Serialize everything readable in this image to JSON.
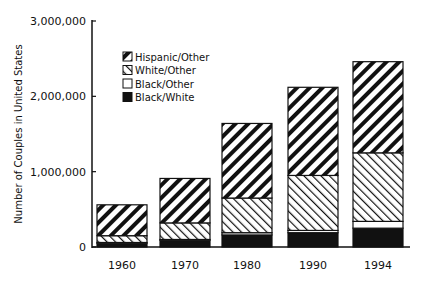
{
  "chart_data": {
    "type": "bar",
    "stacked": true,
    "title": "",
    "xlabel": "",
    "ylabel": "Number of Couples in United States",
    "ylim": [
      0,
      3000000
    ],
    "yticks": [
      0,
      1000000,
      2000000,
      3000000
    ],
    "ytick_labels": [
      "0",
      "1,000,000",
      "2,000,000",
      "3,000,000"
    ],
    "categories": [
      "1960",
      "1970",
      "1980",
      "1990",
      "1994"
    ],
    "series": [
      {
        "name": "Black/White",
        "pattern": "solid-black",
        "values": [
          50000,
          90000,
          160000,
          190000,
          250000
        ]
      },
      {
        "name": "Black/Other",
        "pattern": "white",
        "values": [
          10000,
          10000,
          30000,
          30000,
          90000
        ]
      },
      {
        "name": "White/Other",
        "pattern": "light-diagonal",
        "values": [
          90000,
          220000,
          460000,
          730000,
          910000
        ]
      },
      {
        "name": "Hispanic/Other",
        "pattern": "heavy-diagonal",
        "values": [
          410000,
          590000,
          990000,
          1170000,
          1210000
        ]
      }
    ],
    "totals": [
      560000,
      910000,
      1640000,
      2120000,
      2460000
    ],
    "legend": {
      "position": "upper-left",
      "entries": [
        "Hispanic/Other",
        "White/Other",
        "Black/Other",
        "Black/White"
      ]
    },
    "grid": false
  }
}
